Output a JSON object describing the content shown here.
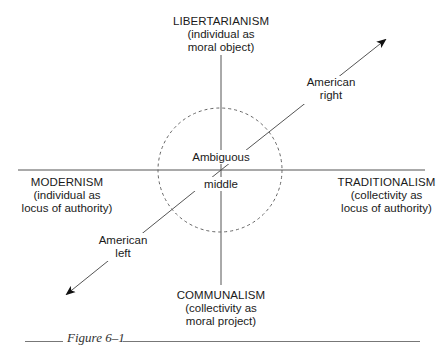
{
  "diagram": {
    "axes": {
      "top": {
        "head": "LIBERTARIANISM",
        "line1": "(individual as",
        "line2": "moral object)"
      },
      "bottom": {
        "head": "COMMUNALISM",
        "line1": "(collectivity as",
        "line2": "moral project)"
      },
      "left": {
        "head": "MODERNISM",
        "line1": "(individual as",
        "line2": "locus of authority)"
      },
      "right": {
        "head": "TRADITIONALISM",
        "line1": "(collectivity as",
        "line2": "locus of authority)"
      }
    },
    "center": {
      "line1": "Ambiguous",
      "line2": "middle"
    },
    "arrows": {
      "upper_right": {
        "line1": "American",
        "line2": "right"
      },
      "lower_left": {
        "line1": "American",
        "line2": "left"
      }
    },
    "colors": {
      "lines": "#555555",
      "text": "#1a1a1a"
    }
  },
  "caption": {
    "label": "Figure 6–1"
  }
}
